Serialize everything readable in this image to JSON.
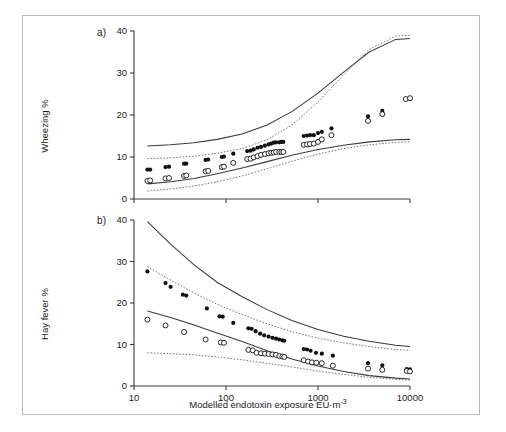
{
  "figure": {
    "caption_letters": {
      "a": "a)",
      "b": "b)"
    },
    "xaxis": {
      "label": "Modelled endotoxin exposure EU·m",
      "label_sup": "-3",
      "scale": "log",
      "ticks": [
        "10",
        "100",
        "1000",
        "10000"
      ],
      "tick_values": [
        10,
        100,
        1000,
        10000
      ],
      "xlim": [
        10,
        10000
      ]
    },
    "colors": {
      "point_filled": "#121212",
      "point_open": "#ffffff",
      "fit_line": "#3a3a3a",
      "ci_line": "#6a6a6a",
      "frame": "#b9b9b9"
    }
  },
  "chart_data": [
    {
      "type": "scatter",
      "panel": "a)",
      "title": "",
      "xlabel": "Modelled endotoxin exposure EU·m-3",
      "ylabel": "Wheezing %",
      "xscale": "log",
      "xlim": [
        10,
        10000
      ],
      "ylim": [
        0,
        40
      ],
      "yticks": [
        0,
        10,
        20,
        30,
        40
      ],
      "ytick_labels": [
        "0",
        "10",
        "20",
        "30",
        "40"
      ],
      "grid": false,
      "legend": "none",
      "series": [
        {
          "name": "filled-circles",
          "marker": "filled circle",
          "x": [
            14,
            15,
            22,
            24,
            35,
            37,
            60,
            64,
            90,
            95,
            120,
            170,
            185,
            200,
            220,
            240,
            265,
            290,
            310,
            330,
            350,
            380,
            400,
            420,
            700,
            760,
            820,
            900,
            1000,
            1100,
            1400,
            3500,
            5000
          ],
          "y": [
            7.0,
            7.0,
            7.6,
            7.7,
            8.4,
            8.4,
            9.3,
            9.4,
            10.0,
            10.1,
            10.8,
            11.4,
            11.5,
            11.8,
            12.2,
            12.4,
            12.7,
            13.0,
            13.2,
            13.4,
            13.5,
            13.5,
            13.6,
            13.6,
            15.0,
            15.1,
            15.2,
            15.2,
            15.7,
            16.0,
            16.8,
            19.7,
            21.0
          ]
        },
        {
          "name": "open-circles",
          "marker": "open circle",
          "x": [
            14,
            15,
            22,
            24,
            35,
            37,
            60,
            64,
            90,
            95,
            120,
            170,
            185,
            200,
            220,
            240,
            265,
            290,
            310,
            330,
            350,
            380,
            400,
            420,
            700,
            760,
            820,
            900,
            1000,
            1100,
            1400,
            3500,
            5000,
            9000,
            10000
          ],
          "y": [
            4.3,
            4.4,
            4.9,
            5.0,
            5.5,
            5.6,
            6.6,
            6.7,
            7.6,
            7.7,
            8.6,
            9.5,
            9.6,
            9.9,
            10.2,
            10.5,
            10.7,
            10.9,
            11.0,
            11.1,
            11.2,
            11.2,
            11.2,
            11.2,
            12.9,
            13.0,
            13.1,
            13.2,
            13.6,
            14.2,
            15.2,
            18.6,
            20.2,
            23.8,
            24.0
          ]
        }
      ],
      "bands": [
        {
          "name": "upper-solid",
          "style": "solid",
          "x": [
            14,
            25,
            45,
            80,
            150,
            280,
            520,
            1000,
            1900,
            3600,
            7000,
            10000
          ],
          "y": [
            12.6,
            12.9,
            13.4,
            14.2,
            15.5,
            17.6,
            20.8,
            25.2,
            30.2,
            35.0,
            38.0,
            38.2
          ]
        },
        {
          "name": "upper-dotted",
          "style": "dotted",
          "x": [
            14,
            25,
            45,
            80,
            150,
            280,
            520,
            1000,
            1900,
            3600,
            7000,
            10000
          ],
          "y": [
            9.6,
            9.8,
            10.2,
            10.9,
            12.0,
            14.1,
            17.6,
            23.1,
            29.6,
            35.6,
            38.8,
            39.0
          ]
        },
        {
          "name": "lower-solid",
          "style": "solid",
          "x": [
            14,
            25,
            45,
            80,
            150,
            280,
            520,
            1000,
            1900,
            3600,
            7000,
            10000
          ],
          "y": [
            3.6,
            4.1,
            4.9,
            6.0,
            7.4,
            8.9,
            10.4,
            11.8,
            12.8,
            13.6,
            14.1,
            14.2
          ]
        },
        {
          "name": "lower-dotted",
          "style": "dotted",
          "x": [
            14,
            25,
            45,
            80,
            150,
            280,
            520,
            1000,
            1900,
            3600,
            7000,
            10000
          ],
          "y": [
            1.9,
            2.4,
            3.1,
            4.1,
            5.5,
            7.2,
            9.0,
            10.7,
            12.0,
            12.9,
            13.5,
            13.6
          ]
        }
      ]
    },
    {
      "type": "scatter",
      "panel": "b)",
      "title": "",
      "xlabel": "Modelled endotoxin exposure EU·m-3",
      "ylabel": "Hay fever %",
      "xscale": "log",
      "xlim": [
        10,
        10000
      ],
      "ylim": [
        0,
        40
      ],
      "yticks": [
        0,
        10,
        20,
        30,
        40
      ],
      "ytick_labels": [
        "0",
        "10",
        "20",
        "30",
        "40"
      ],
      "grid": false,
      "legend": "none",
      "series": [
        {
          "name": "filled-circles",
          "marker": "filled circle",
          "x": [
            14,
            22,
            25,
            34,
            37,
            62,
            85,
            92,
            120,
            175,
            190,
            210,
            235,
            260,
            290,
            320,
            350,
            380,
            410,
            430,
            700,
            760,
            830,
            950,
            1100,
            1450,
            3500,
            5000,
            9200,
            10000
          ],
          "y": [
            27.6,
            24.8,
            23.9,
            22.0,
            21.8,
            18.7,
            16.8,
            16.7,
            15.2,
            13.9,
            13.8,
            13.2,
            12.6,
            12.2,
            11.9,
            11.6,
            11.4,
            11.2,
            11.0,
            10.9,
            8.9,
            8.8,
            8.5,
            8.0,
            7.8,
            7.3,
            5.5,
            5.0,
            4.1,
            4.0
          ]
        },
        {
          "name": "open-circles",
          "marker": "open circle",
          "x": [
            14,
            22,
            35,
            60,
            88,
            95,
            175,
            195,
            215,
            240,
            265,
            290,
            320,
            350,
            380,
            410,
            430,
            700,
            780,
            860,
            960,
            1100,
            1450,
            3500,
            5000,
            9200,
            10000
          ],
          "y": [
            16.0,
            14.6,
            13.0,
            11.2,
            10.5,
            10.4,
            8.7,
            8.6,
            8.0,
            7.9,
            7.8,
            7.7,
            7.6,
            7.5,
            7.2,
            7.1,
            7.0,
            6.2,
            5.9,
            5.7,
            5.6,
            5.5,
            4.9,
            4.2,
            3.9,
            3.6,
            3.5
          ]
        }
      ],
      "bands": [
        {
          "name": "upper-solid",
          "style": "solid",
          "x": [
            14,
            25,
            45,
            80,
            150,
            280,
            520,
            1000,
            1900,
            3600,
            7000,
            10000
          ],
          "y": [
            39.6,
            34.2,
            29.2,
            25.0,
            21.5,
            18.4,
            15.8,
            13.6,
            12.0,
            10.8,
            9.8,
            9.5
          ]
        },
        {
          "name": "upper-dotted",
          "style": "dotted",
          "x": [
            14,
            25,
            45,
            80,
            150,
            280,
            520,
            1000,
            1900,
            3600,
            7000,
            10000
          ],
          "y": [
            28.8,
            25.5,
            22.4,
            19.7,
            17.2,
            15.0,
            13.1,
            11.5,
            10.4,
            9.5,
            8.8,
            8.6
          ]
        },
        {
          "name": "lower-solid",
          "style": "solid",
          "x": [
            14,
            25,
            45,
            80,
            150,
            280,
            520,
            1000,
            1900,
            3600,
            7000,
            10000
          ],
          "y": [
            18.1,
            16.5,
            14.7,
            12.8,
            10.7,
            8.5,
            6.5,
            4.8,
            3.5,
            2.5,
            1.9,
            1.7
          ]
        },
        {
          "name": "lower-dotted",
          "style": "dotted",
          "x": [
            14,
            25,
            45,
            80,
            150,
            280,
            520,
            1000,
            1900,
            3600,
            7000,
            10000
          ],
          "y": [
            8.0,
            7.8,
            7.5,
            7.0,
            6.3,
            5.5,
            4.6,
            3.6,
            2.8,
            2.1,
            1.6,
            1.4
          ]
        }
      ]
    }
  ]
}
